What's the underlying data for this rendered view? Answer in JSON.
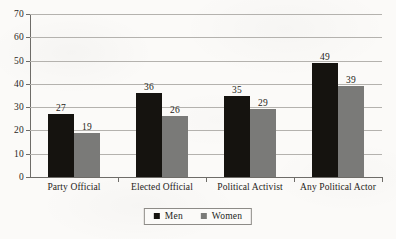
{
  "chart_data": {
    "type": "bar",
    "title": "",
    "subtitle": "",
    "xlabel": "",
    "ylabel": "",
    "ylim": [
      0,
      70
    ],
    "yticks": [
      0,
      10,
      20,
      30,
      40,
      50,
      60,
      70
    ],
    "ytick_labels": [
      "0",
      "10",
      "20",
      "30",
      "40",
      "50",
      "60",
      "70"
    ],
    "grid": true,
    "legend_position": "bottom-center",
    "categories": [
      "Party Official",
      "Elected Official",
      "Political Activist",
      "Any Political Actor"
    ],
    "series": [
      {
        "name": "Men",
        "color": "#15130f",
        "values": [
          27,
          36,
          35,
          49
        ],
        "value_labels": [
          "27",
          "36",
          "35",
          "49"
        ]
      },
      {
        "name": "Women",
        "color": "#7a7a78",
        "values": [
          19,
          26,
          29,
          39
        ],
        "value_labels": [
          "19",
          "26",
          "29",
          "39"
        ]
      }
    ]
  },
  "legend": {
    "items": [
      {
        "label": "Men",
        "color": "#15130f"
      },
      {
        "label": "Women",
        "color": "#7a7a78"
      }
    ]
  },
  "colors": {
    "men_bar": "#15130f",
    "women_bar": "#7a7a78",
    "gridline": "#b4b2ae",
    "axis": "#6e6c68",
    "text": "#221f1c",
    "background": "#fbfaf8"
  }
}
